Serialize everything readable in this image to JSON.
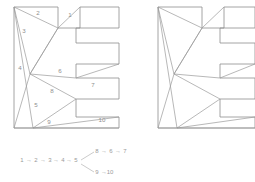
{
  "figure": {
    "line_color": "#9a9a9a",
    "label_color": "#8f8f8f",
    "background": "#ffffff"
  },
  "shapes": [
    {
      "id": "left-polygon",
      "name": "labeled-comb-polygon",
      "labeled": true,
      "outline": "14,7 58,7 58,28 80,28 80,7 119,7 119,28 76,28 76,43 119,43 119,64 76,64 76,78 119,78 119,99 76,99 76,117 119,117 119,128 14,128",
      "diagonals": [
        "14,7 58,28",
        "58,28 80,7",
        "14,7 33,128",
        "14,7 30,74",
        "30,74 58,28",
        "30,74 76,78",
        "30,74 76,99",
        "30,74 14,128",
        "76,78 119,64",
        "76,99 33,128",
        "33,128 119,117",
        "14,128 119,128",
        "58,28 30,74"
      ],
      "vertex_labels": [
        {
          "id": "1",
          "text": "1",
          "x": 70,
          "y": 17
        },
        {
          "id": "2",
          "text": "2",
          "x": 38,
          "y": 15
        },
        {
          "id": "3",
          "text": "3",
          "x": 24,
          "y": 33
        },
        {
          "id": "4",
          "text": "4",
          "x": 20,
          "y": 70
        },
        {
          "id": "5",
          "text": "5",
          "x": 36,
          "y": 107
        },
        {
          "id": "6",
          "text": "6",
          "x": 60,
          "y": 73
        },
        {
          "id": "7",
          "text": "7",
          "x": 93,
          "y": 87
        },
        {
          "id": "8",
          "text": "8",
          "x": 52,
          "y": 93
        },
        {
          "id": "9",
          "text": "9",
          "x": 49,
          "y": 124
        },
        {
          "id": "10",
          "text": "10",
          "x": 102,
          "y": 122
        }
      ]
    },
    {
      "id": "right-polygon",
      "name": "unlabeled-comb-polygon",
      "labeled": false,
      "outline": "158,7 202,7 202,28 224,28 224,7 255,7 255,28 220,28 220,43 255,43 255,64 220,64 220,78 255,78 255,99 220,99 220,117 255,117 255,128 158,128",
      "diagonals": [
        "158,7 202,28",
        "202,28 224,7",
        "158,7 177,128",
        "158,7 174,74",
        "174,74 202,28",
        "174,74 220,78",
        "174,74 220,99",
        "174,74 158,128",
        "220,78 255,64",
        "220,99 177,128",
        "177,128 255,117",
        "158,128 255,128",
        "202,28 174,74"
      ],
      "vertex_labels": []
    }
  ],
  "tree": {
    "name": "dual-tree",
    "arrow_glyph": "→",
    "nodes": [
      {
        "id": "n1",
        "text": "1",
        "x": 22,
        "y": 162
      },
      {
        "id": "n2",
        "text": "2",
        "x": 36,
        "y": 162
      },
      {
        "id": "n3",
        "text": "3",
        "x": 50,
        "y": 162
      },
      {
        "id": "n4",
        "text": "4",
        "x": 63,
        "y": 162
      },
      {
        "id": "n5",
        "text": "5",
        "x": 76,
        "y": 162
      },
      {
        "id": "n8",
        "text": "8",
        "x": 97,
        "y": 153
      },
      {
        "id": "n6",
        "text": "6",
        "x": 111,
        "y": 153
      },
      {
        "id": "n7",
        "text": "7",
        "x": 125,
        "y": 153
      },
      {
        "id": "n9",
        "text": "9",
        "x": 97,
        "y": 174
      },
      {
        "id": "n10",
        "text": "10",
        "x": 110,
        "y": 174
      }
    ],
    "arrows": [
      {
        "id": "a1",
        "text": "→",
        "x": 29,
        "y": 162
      },
      {
        "id": "a2",
        "text": "→",
        "x": 43,
        "y": 162
      },
      {
        "id": "a3",
        "text": "→",
        "x": 56,
        "y": 162
      },
      {
        "id": "a4",
        "text": "→",
        "x": 69,
        "y": 162
      },
      {
        "id": "a5",
        "text": "→",
        "x": 104,
        "y": 153
      },
      {
        "id": "a6",
        "text": "→",
        "x": 118,
        "y": 153
      },
      {
        "id": "a7",
        "text": "→",
        "x": 104,
        "y": 174
      }
    ],
    "branches": [
      "81,160 94,152",
      "81,164 94,172"
    ],
    "sequence_main": "1 → 2 → 3 → 4 → 5",
    "branch_upper": "8 → 6 → 7",
    "branch_lower": "9 → 10"
  }
}
